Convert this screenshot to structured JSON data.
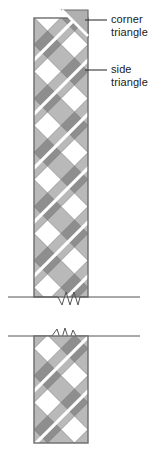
{
  "diagram": {
    "type": "quilting-sashing-strip",
    "colors": {
      "background": "#ffffff",
      "strip_fill": "#b9b9b9",
      "strip_outline": "#6b6b6b",
      "diamond_light": "#ffffff",
      "diamond_dark": "#8e8e8e",
      "seam_line": "#ffffff",
      "leader_line": "#333333",
      "break_line": "#555555",
      "label_text": "#1a1a1a"
    },
    "strip": {
      "left": 34,
      "right": 88,
      "width": 54,
      "top_segment": {
        "top": 18,
        "bottom": 297
      },
      "bottom_segment": {
        "top": 336,
        "bottom": 443
      }
    },
    "break_marks": [
      {
        "name": "upper-break",
        "y": 297,
        "x_start": 8,
        "x_end": 140
      },
      {
        "name": "lower-break",
        "y": 336,
        "x_start": 8,
        "x_end": 140
      }
    ],
    "diamond_unit": {
      "size": 27,
      "rows_top": 10,
      "rows_bottom": 4
    },
    "annotations": [
      {
        "id": "corner",
        "label_line_1": "corner",
        "label_line_2": "triangle",
        "leader": {
          "x_start": 85,
          "x_end": 107,
          "y": 20
        }
      },
      {
        "id": "side",
        "label_line_1": "side",
        "label_line_2": "triangle",
        "leader": {
          "x_start": 85,
          "x_end": 107,
          "y": 70
        }
      }
    ]
  }
}
